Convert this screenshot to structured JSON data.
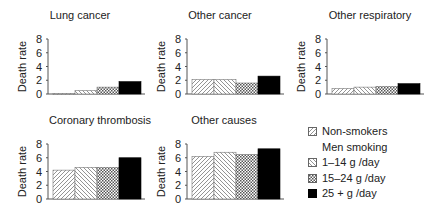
{
  "chart_data": {
    "type": "bar",
    "ylabel": "Death rate",
    "ylim": [
      0,
      8
    ],
    "yticks": [
      0,
      2,
      4,
      6,
      8
    ],
    "series_names": [
      "Non-smokers",
      "1–14 g/day",
      "15–24 g/day",
      "25+ g/day"
    ],
    "categories": [
      "Non-smokers",
      "1–14 g/day",
      "15–24 g/day",
      "25+ g/day"
    ],
    "panels": [
      {
        "title": "Lung cancer",
        "values": [
          0.07,
          0.5,
          1.0,
          1.8
        ]
      },
      {
        "title": "Other cancer",
        "values": [
          2.1,
          2.1,
          1.6,
          2.6
        ]
      },
      {
        "title": "Other respiratory",
        "values": [
          0.8,
          1.0,
          1.1,
          1.5
        ]
      },
      {
        "title": "Coronary thrombosis",
        "values": [
          4.2,
          4.6,
          4.6,
          6.0
        ]
      },
      {
        "title": "Other causes",
        "values": [
          6.2,
          6.8,
          6.5,
          7.3
        ]
      }
    ],
    "legend": {
      "position": "bottom-right",
      "entries": [
        {
          "label": "Non-smokers",
          "pattern": "diag-right"
        },
        {
          "label": "Men smoking",
          "pattern": "none"
        },
        {
          "label": "1–14 g /day",
          "pattern": "diag-left"
        },
        {
          "label": "15–24 g /day",
          "pattern": "crosshatch"
        },
        {
          "label": "25 + g /day",
          "pattern": "solid"
        }
      ]
    },
    "grid": false
  },
  "colors": {
    "solid": "#000000",
    "hatch": "#555555",
    "axis": "#555555",
    "text": "#222222"
  }
}
